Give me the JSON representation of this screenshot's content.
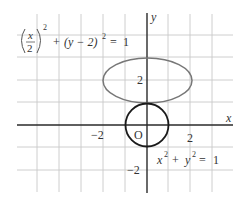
{
  "diagram": {
    "type": "coordinate-plane",
    "axes": {
      "x_label": "x",
      "y_label": "y",
      "origin_label": "O",
      "tick_labels": {
        "x_neg2": "−2",
        "x_pos2": "2",
        "y_pos2": "2",
        "y_neg2": "−2"
      }
    },
    "curves": [
      {
        "name": "ellipse",
        "equation_parts": {
          "frac_num": "x",
          "frac_den": "2",
          "outer_exp": "2",
          "plus": "+",
          "term2": "(y − 2)",
          "term2_exp": "2",
          "equals": "=",
          "rhs": "1"
        },
        "center": [
          0,
          2
        ],
        "semi_axes": [
          2,
          1
        ],
        "color": "#777777"
      },
      {
        "name": "circle",
        "equation_parts": {
          "x": "x",
          "x_exp": "2",
          "plus": "+",
          "y": "y",
          "y_exp": "2",
          "equals": "=",
          "rhs": "1"
        },
        "center": [
          0,
          0
        ],
        "radius": 1,
        "color": "#1a1a1a"
      }
    ],
    "grid": {
      "unit_px": 22,
      "color": "#c8c8c8"
    }
  }
}
